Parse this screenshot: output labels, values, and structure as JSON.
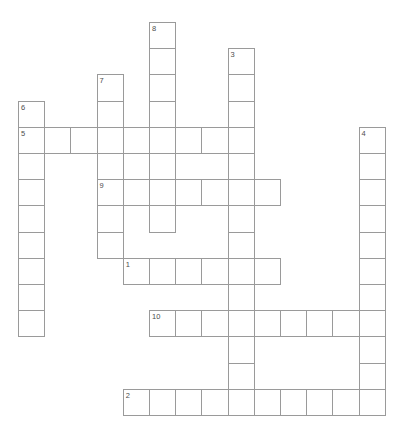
{
  "puzzle": {
    "title": "Crossword Puzzle Grid",
    "background_color": "#ffffff",
    "cell_border_color": "#9a9a9a",
    "cell_fill_color": "#ffffff",
    "number_color": "#4d4d4d",
    "cell_size_px": 26.2,
    "origin_x_px": 18,
    "origin_y_px": 22,
    "grid_columns": 14,
    "grid_rows": 15,
    "entries": [
      {
        "number": "1",
        "direction": "across",
        "row": 9,
        "col": 4,
        "length": 6
      },
      {
        "number": "2",
        "direction": "across",
        "row": 14,
        "col": 4,
        "length": 10
      },
      {
        "number": "3",
        "direction": "down",
        "row": 1,
        "col": 8,
        "length": 14
      },
      {
        "number": "4",
        "direction": "down",
        "row": 4,
        "col": 13,
        "length": 11
      },
      {
        "number": "5",
        "direction": "across",
        "row": 4,
        "col": 0,
        "length": 9
      },
      {
        "number": "6",
        "direction": "down",
        "row": 3,
        "col": 0,
        "length": 9
      },
      {
        "number": "7",
        "direction": "down",
        "row": 2,
        "col": 3,
        "length": 7
      },
      {
        "number": "8",
        "direction": "down",
        "row": 0,
        "col": 5,
        "length": 8
      },
      {
        "number": "9",
        "direction": "across",
        "row": 6,
        "col": 3,
        "length": 7
      },
      {
        "number": "10",
        "direction": "across",
        "row": 11,
        "col": 5,
        "length": 8
      }
    ],
    "cells": [
      {
        "row": 0,
        "col": 5,
        "number": "8",
        "letter": ""
      },
      {
        "row": 1,
        "col": 5,
        "number": "",
        "letter": ""
      },
      {
        "row": 1,
        "col": 8,
        "number": "3",
        "letter": ""
      },
      {
        "row": 2,
        "col": 3,
        "number": "7",
        "letter": ""
      },
      {
        "row": 2,
        "col": 5,
        "number": "",
        "letter": ""
      },
      {
        "row": 2,
        "col": 8,
        "number": "",
        "letter": ""
      },
      {
        "row": 3,
        "col": 0,
        "number": "6",
        "letter": ""
      },
      {
        "row": 3,
        "col": 3,
        "number": "",
        "letter": ""
      },
      {
        "row": 3,
        "col": 5,
        "number": "",
        "letter": ""
      },
      {
        "row": 3,
        "col": 8,
        "number": "",
        "letter": ""
      },
      {
        "row": 4,
        "col": 0,
        "number": "5",
        "letter": ""
      },
      {
        "row": 4,
        "col": 1,
        "number": "",
        "letter": ""
      },
      {
        "row": 4,
        "col": 2,
        "number": "",
        "letter": ""
      },
      {
        "row": 4,
        "col": 3,
        "number": "",
        "letter": ""
      },
      {
        "row": 4,
        "col": 4,
        "number": "",
        "letter": ""
      },
      {
        "row": 4,
        "col": 5,
        "number": "",
        "letter": ""
      },
      {
        "row": 4,
        "col": 6,
        "number": "",
        "letter": ""
      },
      {
        "row": 4,
        "col": 7,
        "number": "",
        "letter": ""
      },
      {
        "row": 4,
        "col": 8,
        "number": "",
        "letter": ""
      },
      {
        "row": 4,
        "col": 13,
        "number": "4",
        "letter": ""
      },
      {
        "row": 5,
        "col": 0,
        "number": "",
        "letter": ""
      },
      {
        "row": 5,
        "col": 3,
        "number": "",
        "letter": ""
      },
      {
        "row": 5,
        "col": 5,
        "number": "",
        "letter": ""
      },
      {
        "row": 5,
        "col": 8,
        "number": "",
        "letter": ""
      },
      {
        "row": 5,
        "col": 13,
        "number": "",
        "letter": ""
      },
      {
        "row": 6,
        "col": 0,
        "number": "",
        "letter": ""
      },
      {
        "row": 6,
        "col": 3,
        "number": "9",
        "letter": ""
      },
      {
        "row": 6,
        "col": 4,
        "number": "",
        "letter": ""
      },
      {
        "row": 6,
        "col": 5,
        "number": "",
        "letter": ""
      },
      {
        "row": 6,
        "col": 6,
        "number": "",
        "letter": ""
      },
      {
        "row": 6,
        "col": 7,
        "number": "",
        "letter": ""
      },
      {
        "row": 6,
        "col": 8,
        "number": "",
        "letter": ""
      },
      {
        "row": 6,
        "col": 9,
        "number": "",
        "letter": ""
      },
      {
        "row": 6,
        "col": 13,
        "number": "",
        "letter": ""
      },
      {
        "row": 7,
        "col": 0,
        "number": "",
        "letter": ""
      },
      {
        "row": 7,
        "col": 3,
        "number": "",
        "letter": ""
      },
      {
        "row": 7,
        "col": 5,
        "number": "",
        "letter": ""
      },
      {
        "row": 7,
        "col": 8,
        "number": "",
        "letter": ""
      },
      {
        "row": 7,
        "col": 13,
        "number": "",
        "letter": ""
      },
      {
        "row": 8,
        "col": 0,
        "number": "",
        "letter": ""
      },
      {
        "row": 8,
        "col": 3,
        "number": "",
        "letter": ""
      },
      {
        "row": 8,
        "col": 8,
        "number": "",
        "letter": ""
      },
      {
        "row": 8,
        "col": 13,
        "number": "",
        "letter": ""
      },
      {
        "row": 9,
        "col": 0,
        "number": "",
        "letter": ""
      },
      {
        "row": 9,
        "col": 4,
        "number": "1",
        "letter": ""
      },
      {
        "row": 9,
        "col": 5,
        "number": "",
        "letter": ""
      },
      {
        "row": 9,
        "col": 6,
        "number": "",
        "letter": ""
      },
      {
        "row": 9,
        "col": 7,
        "number": "",
        "letter": ""
      },
      {
        "row": 9,
        "col": 8,
        "number": "",
        "letter": ""
      },
      {
        "row": 9,
        "col": 9,
        "number": "",
        "letter": ""
      },
      {
        "row": 9,
        "col": 13,
        "number": "",
        "letter": ""
      },
      {
        "row": 10,
        "col": 0,
        "number": "",
        "letter": ""
      },
      {
        "row": 10,
        "col": 8,
        "number": "",
        "letter": ""
      },
      {
        "row": 10,
        "col": 13,
        "number": "",
        "letter": ""
      },
      {
        "row": 11,
        "col": 0,
        "number": "",
        "letter": ""
      },
      {
        "row": 11,
        "col": 5,
        "number": "10",
        "letter": ""
      },
      {
        "row": 11,
        "col": 6,
        "number": "",
        "letter": ""
      },
      {
        "row": 11,
        "col": 7,
        "number": "",
        "letter": ""
      },
      {
        "row": 11,
        "col": 8,
        "number": "",
        "letter": ""
      },
      {
        "row": 11,
        "col": 9,
        "number": "",
        "letter": ""
      },
      {
        "row": 11,
        "col": 10,
        "number": "",
        "letter": ""
      },
      {
        "row": 11,
        "col": 11,
        "number": "",
        "letter": ""
      },
      {
        "row": 11,
        "col": 12,
        "number": "",
        "letter": ""
      },
      {
        "row": 11,
        "col": 13,
        "number": "",
        "letter": ""
      },
      {
        "row": 12,
        "col": 8,
        "number": "",
        "letter": ""
      },
      {
        "row": 12,
        "col": 13,
        "number": "",
        "letter": ""
      },
      {
        "row": 13,
        "col": 8,
        "number": "",
        "letter": ""
      },
      {
        "row": 13,
        "col": 13,
        "number": "",
        "letter": ""
      },
      {
        "row": 14,
        "col": 4,
        "number": "2",
        "letter": ""
      },
      {
        "row": 14,
        "col": 5,
        "number": "",
        "letter": ""
      },
      {
        "row": 14,
        "col": 6,
        "number": "",
        "letter": ""
      },
      {
        "row": 14,
        "col": 7,
        "number": "",
        "letter": ""
      },
      {
        "row": 14,
        "col": 8,
        "number": "",
        "letter": ""
      },
      {
        "row": 14,
        "col": 9,
        "number": "",
        "letter": ""
      },
      {
        "row": 14,
        "col": 10,
        "number": "",
        "letter": ""
      },
      {
        "row": 14,
        "col": 11,
        "number": "",
        "letter": ""
      },
      {
        "row": 14,
        "col": 12,
        "number": "",
        "letter": ""
      },
      {
        "row": 14,
        "col": 13,
        "number": "",
        "letter": ""
      }
    ]
  }
}
